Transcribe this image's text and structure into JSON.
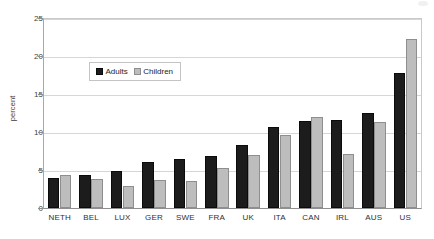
{
  "chart_data": {
    "type": "bar",
    "title": "",
    "xlabel": "",
    "ylabel": "percent",
    "ylim": [
      0,
      25
    ],
    "yticks": [
      0,
      5,
      10,
      15,
      20,
      25
    ],
    "grid": true,
    "legend_position": "inside-upper-left",
    "categories": [
      "NETH",
      "BEL",
      "LUX",
      "GER",
      "SWE",
      "FRA",
      "UK",
      "ITA",
      "CAN",
      "IRL",
      "AUS",
      "US"
    ],
    "series": [
      {
        "name": "Adults",
        "color": "#1c1c1c",
        "values": [
          4.0,
          4.4,
          4.9,
          6.1,
          6.5,
          6.9,
          8.3,
          10.6,
          11.5,
          11.6,
          12.5,
          17.8
        ]
      },
      {
        "name": "Children",
        "color": "#bdbdbd",
        "values": [
          4.3,
          3.8,
          2.9,
          3.7,
          3.5,
          5.2,
          7.0,
          9.6,
          12.0,
          7.1,
          11.3,
          22.3
        ]
      }
    ]
  }
}
